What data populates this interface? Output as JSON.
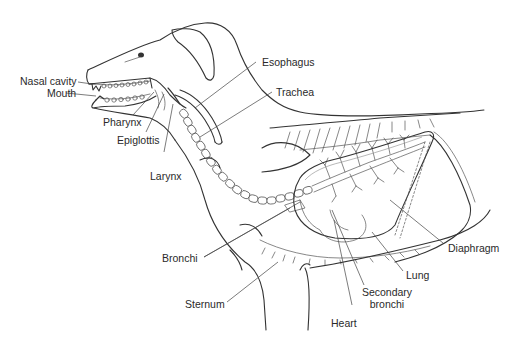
{
  "figure": {
    "labels": {
      "nasal_cavity": "Nasal cavity",
      "mouth": "Mouth",
      "pharynx": "Pharynx",
      "epiglottis": "Epiglottis",
      "larynx": "Larynx",
      "esophagus": "Esophagus",
      "trachea": "Trachea",
      "bronchi": "Bronchi",
      "sternum": "Sternum",
      "heart": "Heart",
      "secondary_bronchi_line1": "Secondary",
      "secondary_bronchi_line2": "bronchi",
      "lung": "Lung",
      "diaphragm": "Diaphragm"
    },
    "colors": {
      "line": "#333333",
      "text": "#2a2a2a",
      "background": "#ffffff"
    }
  }
}
